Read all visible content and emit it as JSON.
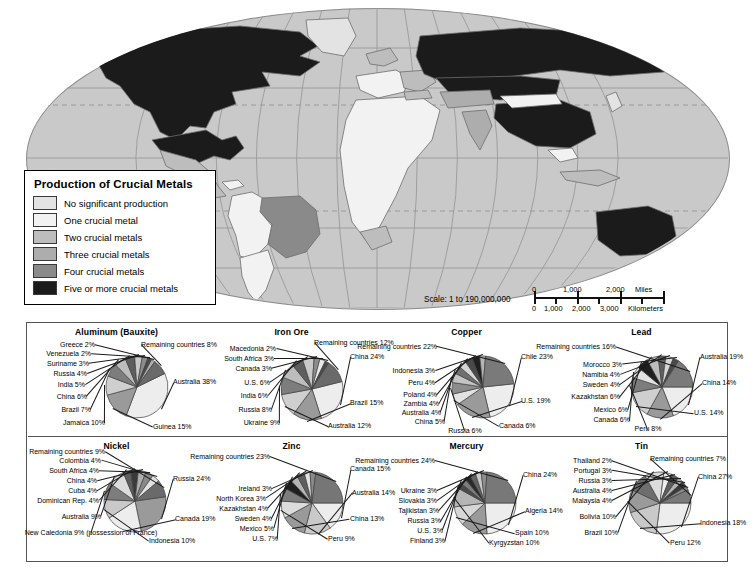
{
  "map": {
    "title_semantic": "world-map-crucial-metals",
    "scale": {
      "label": "Scale:  1 to 190,000,000",
      "miles": {
        "unit": "Miles",
        "ticks": [
          "0",
          "1,000",
          "2,000"
        ]
      },
      "kilometers": {
        "unit": "Kilometers",
        "ticks": [
          "0",
          "1,000",
          "2,000",
          "3,000"
        ]
      }
    }
  },
  "legend": {
    "title": "Production of Crucial Metals",
    "items": [
      {
        "label": "No significant production",
        "color": "#e3e3e3"
      },
      {
        "label": "One crucial metal",
        "color": "#f2f2f2"
      },
      {
        "label": "Two crucial metals",
        "color": "#bdbdbd"
      },
      {
        "label": "Three crucial metals",
        "color": "#adadad"
      },
      {
        "label": "Four crucial metals",
        "color": "#8a8a8a"
      },
      {
        "label": "Five or more crucial metals",
        "color": "#1b1b1b"
      }
    ]
  },
  "chart_data": [
    {
      "type": "pie",
      "title": "Aluminum (Bauxite)",
      "unit": "%",
      "categories": [
        "Australia",
        "Guinea",
        "Jamaica",
        "Brazil",
        "China",
        "India",
        "Russia",
        "Suriname",
        "Venezuela",
        "Greece",
        "Remaining countries"
      ],
      "values": [
        38,
        15,
        10,
        7,
        6,
        5,
        4,
        3,
        2,
        2,
        8
      ],
      "labels": [
        "Australia 38%",
        "Guinea 15%",
        "Jamaica 10%",
        "Brazil 7%",
        "China 6%",
        "India 5%",
        "Russia 4%",
        "Suriname 3%",
        "Venezuela 2%",
        "Greece 2%",
        "Remaining countries 8%"
      ],
      "colors": [
        "#ededed",
        "#9a9a9a",
        "#cfcfcf",
        "#7d7d7d",
        "#bdbdbd",
        "#5e5e5e",
        "#c9c9c9",
        "#8c8c8c",
        "#4a4a4a",
        "#b0b0b0",
        "#6a6a6a"
      ]
    },
    {
      "type": "pie",
      "title": "Iron Ore",
      "unit": "%",
      "categories": [
        "China",
        "Brazil",
        "Australia",
        "Ukraine",
        "Russia",
        "India",
        "U.S.",
        "Canada",
        "South Africa",
        "Macedonia",
        "Remaining countries"
      ],
      "values": [
        24,
        15,
        12,
        9,
        8,
        6,
        6,
        3,
        3,
        2,
        12
      ],
      "labels": [
        "China 24%",
        "Brazil 15%",
        "Australia 12%",
        "Ukraine 9%",
        "Russia 8%",
        "India 6%",
        "U.S. 6%",
        "Canada 3%",
        "South Africa 3%",
        "Macedonia 2%",
        "Remaining countries 12%"
      ],
      "colors": [
        "#ededed",
        "#9a9a9a",
        "#cfcfcf",
        "#7d7d7d",
        "#bdbdbd",
        "#5e5e5e",
        "#c9c9c9",
        "#8c8c8c",
        "#e8e8e8",
        "#4a4a4a",
        "#6a6a6a"
      ]
    },
    {
      "type": "pie",
      "title": "Copper",
      "unit": "%",
      "categories": [
        "Chile",
        "U.S.",
        "Canada",
        "Russia",
        "China",
        "Australia",
        "Zambia",
        "Poland",
        "Peru",
        "Indonesia",
        "Remaining countries"
      ],
      "values": [
        23,
        19,
        6,
        6,
        5,
        4,
        4,
        4,
        4,
        3,
        22
      ],
      "labels": [
        "Chile 23%",
        "U.S. 19%",
        "Canada 6%",
        "Russia 6%",
        "China 5%",
        "Australia 4%",
        "Zambia 4%",
        "Poland 4%",
        "Peru 4%",
        "Indonesia 3%",
        "Remaining countries 22%"
      ],
      "colors": [
        "#ededed",
        "#9a9a9a",
        "#e2e2e2",
        "#8c8c8c",
        "#c4c4c4",
        "#6f6f6f",
        "#d6d6d6",
        "#4a4a4a",
        "#1f1f1f",
        "#b5b5b5",
        "#7a7a7a"
      ]
    },
    {
      "type": "pie",
      "title": "Lead",
      "unit": "%",
      "categories": [
        "Australia",
        "China",
        "U.S.",
        "Peru",
        "Canada",
        "Mexico",
        "Kazakhstan",
        "Sweden",
        "Namibia",
        "Morocco",
        "Remaining countries"
      ],
      "values": [
        19,
        14,
        14,
        8,
        6,
        6,
        6,
        4,
        4,
        3,
        16
      ],
      "labels": [
        "Australia 19%",
        "China 14%",
        "U.S. 14%",
        "Peru 8%",
        "Canada 6%",
        "Mexico 6%",
        "Kazakhstan 6%",
        "Sweden 4%",
        "Namibia 4%",
        "Morocco 3%",
        "Remaining countries 16%"
      ],
      "colors": [
        "#ededed",
        "#9a9a9a",
        "#cfcfcf",
        "#7d7d7d",
        "#e2e2e2",
        "#1f1f1f",
        "#bdbdbd",
        "#5e5e5e",
        "#d6d6d6",
        "#4a4a4a",
        "#7a7a7a"
      ]
    },
    {
      "type": "pie",
      "title": "Nickel",
      "unit": "%",
      "categories": [
        "Russia",
        "Canada",
        "Indonesia",
        "New Caledonia (possession of France)",
        "Australia",
        "Dominican Rep.",
        "Cuba",
        "China",
        "South Africa",
        "Colombia",
        "Remaining countries"
      ],
      "values": [
        24,
        19,
        10,
        9,
        9,
        4,
        4,
        4,
        4,
        4,
        9
      ],
      "labels": [
        "Russia 24%",
        "Canada 19%",
        "Indonesia 10%",
        "New Caledonia 9% (possession of France)",
        "Australia 9%",
        "Dominican Rep. 4%",
        "Cuba 4%",
        "China 4%",
        "South Africa 4%",
        "Colombia 4%",
        "Remaining countries 9%"
      ],
      "colors": [
        "#9a9a9a",
        "#ededed",
        "#c9c9c9",
        "#7d7d7d",
        "#dcdcdc",
        "#5e5e5e",
        "#3a3a3a",
        "#aeaeae",
        "#8a8a8a",
        "#e2e2e2",
        "#6a6a6a"
      ]
    },
    {
      "type": "pie",
      "title": "Zinc",
      "unit": "%",
      "categories": [
        "Canada",
        "Australia",
        "China",
        "Peru",
        "U.S.",
        "Mexico",
        "Sweden",
        "Kazakhstan",
        "North Korea",
        "Ireland",
        "Remaining countries"
      ],
      "values": [
        15,
        14,
        13,
        9,
        7,
        5,
        4,
        4,
        3,
        3,
        23
      ],
      "labels": [
        "Canada 15%",
        "Australia 14%",
        "China 13%",
        "Peru 9%",
        "U.S. 7%",
        "Mexico 5%",
        "Sweden 4%",
        "Kazakhstan 4%",
        "North Korea 3%",
        "Ireland 3%",
        "Remaining countries 23%"
      ],
      "colors": [
        "#ededed",
        "#c9c9c9",
        "#9a9a9a",
        "#dcdcdc",
        "#7d7d7d",
        "#1f1f1f",
        "#b5b5b5",
        "#5e5e5e",
        "#e2e2e2",
        "#8a8a8a",
        "#767676"
      ]
    },
    {
      "type": "pie",
      "title": "Mercury",
      "unit": "%",
      "categories": [
        "China",
        "Algeria",
        "Spain",
        "Kyrgyzstan",
        "Finland",
        "U.S.",
        "Russia",
        "Tajikistan",
        "Slovakia",
        "Ukraine",
        "Remaining countries"
      ],
      "values": [
        24,
        14,
        10,
        10,
        3,
        3,
        3,
        3,
        3,
        3,
        24
      ],
      "labels": [
        "China 24%",
        "Algeria 14%",
        "Spain 10%",
        "Kyrgyzstan 10%",
        "Finland 3%",
        "U.S. 3%",
        "Russia 3%",
        "Tajikistan 3%",
        "Slovakia 3%",
        "Ukraine 3%",
        "Remaining countries 24%"
      ],
      "colors": [
        "#ededed",
        "#9a9a9a",
        "#d6d6d6",
        "#b5b5b5",
        "#4a4a4a",
        "#7d7d7d",
        "#2a2a2a",
        "#636363",
        "#c9c9c9",
        "#8f8f8f",
        "#787878"
      ]
    },
    {
      "type": "pie",
      "title": "Tin",
      "unit": "%",
      "categories": [
        "China",
        "Indonesia",
        "Peru",
        "Brazil",
        "Bolivia",
        "Malaysia",
        "Australia",
        "Russia",
        "Portugal",
        "Thailand",
        "Remaining countries"
      ],
      "values": [
        27,
        18,
        12,
        10,
        10,
        4,
        4,
        3,
        3,
        2,
        7
      ],
      "labels": [
        "China 27%",
        "Indonesia 18%",
        "Peru 12%",
        "Brazil 10%",
        "Bolivia 10%",
        "Malaysia 4%",
        "Australia 4%",
        "Russia 3%",
        "Portugal 3%",
        "Thailand 2%",
        "Remaining countries 7%"
      ],
      "colors": [
        "#ededed",
        "#c9c9c9",
        "#9a9a9a",
        "#6e6e6e",
        "#dcdcdc",
        "#efefef",
        "#5e5e5e",
        "#b5b5b5",
        "#3a3a3a",
        "#8a8a8a",
        "#7a7a7a"
      ]
    }
  ]
}
